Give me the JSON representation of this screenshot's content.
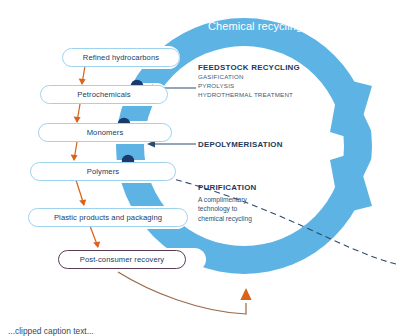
{
  "diagram": {
    "title": "Chemical recycling",
    "colors": {
      "ring_blue": "#5cb3e4",
      "pill_border": "#9ed3ef",
      "accent_pill_border": "#5c3a54",
      "dot_navy": "#1b3a6b",
      "arrow_orange": "#d9631a",
      "curve_brown": "#9c6b4a",
      "callout_navy": "#1d3a5c",
      "text_white": "#ffffff"
    },
    "chain": [
      {
        "label": "Refined hydrocarbons"
      },
      {
        "label": "Petrochemicals"
      },
      {
        "label": "Monomers"
      },
      {
        "label": "Polymers"
      },
      {
        "label": "Plastic products and packaging"
      },
      {
        "label": "Post-consumer recovery"
      }
    ],
    "callouts": [
      {
        "heading": "FEEDSTOCK RECYCLING",
        "lines": [
          "GASIFICATION",
          "PYROLYSIS",
          "HYDROTHERMAL TREATMENT"
        ]
      },
      {
        "heading": "DEPOLYMERISATION",
        "lines": []
      },
      {
        "heading": "PURIFICATION",
        "lines": [
          "A complimentary",
          "technology to",
          "chemical recycling"
        ]
      }
    ],
    "footnote": "...clipped caption text..."
  }
}
